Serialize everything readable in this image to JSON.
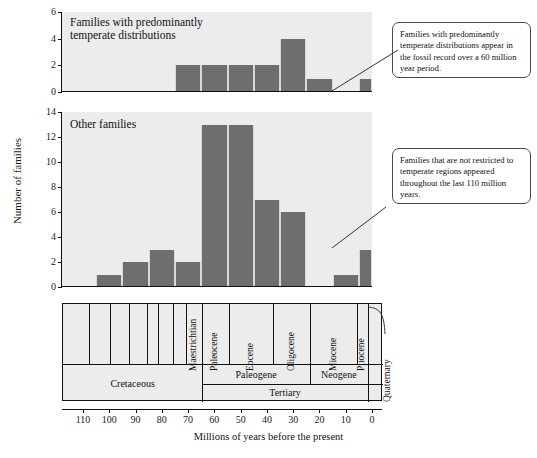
{
  "figure": {
    "y_axis_title": "Number of families",
    "x_axis_title": "Millions of years before the present"
  },
  "chart_data": [
    {
      "type": "bar",
      "title": "Families with predominantly\ntemperate distributions",
      "xlabel": "Millions of years before the present",
      "ylabel": "Number of families",
      "xlim": [
        115,
        0
      ],
      "ylim": [
        0,
        6
      ],
      "yticks": [
        0,
        2,
        4,
        6
      ],
      "grid": false,
      "bin_width": 10,
      "bar_color": "#6e6e6e",
      "categories": [
        "115-105",
        "105-95",
        "95-85",
        "85-75",
        "75-65",
        "65-55",
        "55-45",
        "45-35",
        "35-25",
        "25-15",
        "15-5",
        "5-0"
      ],
      "values": [
        0,
        0,
        0,
        0,
        2,
        2,
        2,
        2,
        4,
        1,
        0,
        1
      ]
    },
    {
      "type": "bar",
      "title": "Other families",
      "xlabel": "Millions of years before the present",
      "ylabel": "Number of families",
      "xlim": [
        115,
        0
      ],
      "ylim": [
        0,
        14
      ],
      "yticks": [
        0,
        2,
        4,
        6,
        8,
        10,
        12,
        14
      ],
      "grid": false,
      "bin_width": 10,
      "bar_color": "#6e6e6e",
      "categories": [
        "115-105",
        "105-95",
        "95-85",
        "85-75",
        "75-65",
        "65-55",
        "55-45",
        "45-35",
        "35-25",
        "25-15",
        "15-5",
        "5-0"
      ],
      "values": [
        0,
        1,
        2,
        3,
        2,
        13,
        13,
        7,
        6,
        0,
        1,
        3
      ]
    }
  ],
  "callouts": [
    {
      "id": "temperate-callout",
      "text": "Families with predominantly temperate distributions appear in the fossil record over a 60 million year period."
    },
    {
      "id": "other-callout",
      "text": "Families that are not restricted to temperate regions appeared throughout the last 110 million years."
    }
  ],
  "timescale": {
    "epochs": [
      {
        "name": "Maestrichtian",
        "start": 71,
        "end": 65
      },
      {
        "name": "Paleocene",
        "start": 65,
        "end": 55
      },
      {
        "name": "Eocene",
        "start": 55,
        "end": 38
      },
      {
        "name": "Oligocene",
        "start": 38,
        "end": 24
      },
      {
        "name": "Miocene",
        "start": 24,
        "end": 6
      },
      {
        "name": "Pliocene",
        "start": 6,
        "end": 2
      }
    ],
    "cretaceous_subdivisions": [
      115,
      108,
      100,
      93,
      86,
      82,
      76,
      71
    ],
    "periods": [
      {
        "name": "Cretaceous",
        "start": 118,
        "end": 65
      },
      {
        "name": "Paleogene",
        "start": 65,
        "end": 24
      },
      {
        "name": "Neogene",
        "start": 24,
        "end": 2
      }
    ],
    "eras": [
      {
        "name": "Tertiary",
        "start": 65,
        "end": 2
      }
    ],
    "bracket_label": "Quaternary"
  },
  "x_ticks": [
    {
      "label": "110",
      "value": 110
    },
    {
      "label": "100",
      "value": 100
    },
    {
      "label": "90",
      "value": 90
    },
    {
      "label": "80",
      "value": 80
    },
    {
      "label": "70",
      "value": 70
    },
    {
      "label": "60",
      "value": 60
    },
    {
      "label": "50",
      "value": 50
    },
    {
      "label": "40",
      "value": 40
    },
    {
      "label": "30",
      "value": 30
    },
    {
      "label": "20",
      "value": 20
    },
    {
      "label": "10",
      "value": 10
    },
    {
      "label": "0",
      "value": 0
    }
  ]
}
